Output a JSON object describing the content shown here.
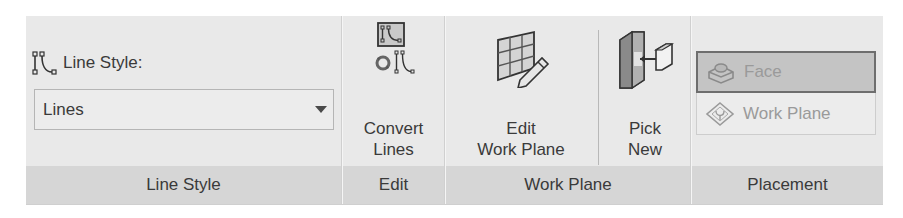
{
  "ribbon": {
    "panels": [
      {
        "id": "line-style",
        "label": "Line Style",
        "line_style_label": "Line Style:",
        "line_style_icon": "line-style-icon",
        "dropdown": {
          "selected": "Lines",
          "arrow_icon": "dropdown-arrow-icon"
        }
      },
      {
        "id": "edit",
        "label": "Edit",
        "buttons": [
          {
            "label_line1": "Convert",
            "label_line2": "Lines",
            "icon": "convert-lines-icon"
          }
        ]
      },
      {
        "id": "work-plane",
        "label": "Work Plane",
        "buttons": [
          {
            "label_line1": "Edit",
            "label_line2": "Work Plane",
            "icon": "edit-work-plane-icon"
          },
          {
            "label_line1": "Pick",
            "label_line2": "New",
            "icon": "pick-new-icon"
          }
        ]
      },
      {
        "id": "placement",
        "label": "Placement",
        "options": [
          {
            "label": "Face",
            "icon": "face-icon",
            "state": "active",
            "enabled": false
          },
          {
            "label": "Work Plane",
            "icon": "work-plane-icon",
            "state": "inactive",
            "enabled": false
          }
        ]
      }
    ]
  },
  "colors": {
    "ribbon_bg": "#e9e9e9",
    "panel_label_bg": "#d6d6d6",
    "text": "#3a3a3a",
    "disabled_text": "#9a9a9a",
    "active_option_bg": "#c4c4c4"
  }
}
